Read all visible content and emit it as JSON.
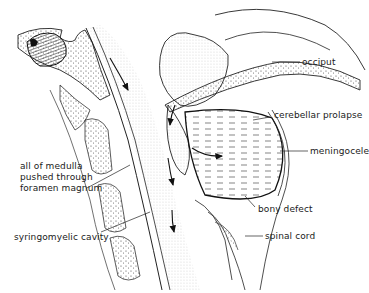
{
  "figure": {
    "labels": {
      "occiput": "occiput",
      "cerebellar_prolapse": "cerebellar prolapse",
      "meningocele": "meningocele",
      "bony_defect": "bony defect",
      "spinal_cord": "spinal cord",
      "medulla": "all of medulla\npushed through\nforamen magnum",
      "syringomyelic_cavity": "syringomyelic cavity"
    },
    "colors": {
      "ink": "#1a1a1a",
      "background": "#ffffff",
      "stipple": "#555555"
    }
  }
}
